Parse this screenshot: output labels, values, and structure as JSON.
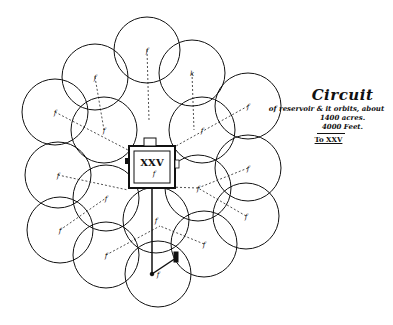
{
  "diagram": {
    "central_label": "XXV",
    "central_mark": "f",
    "legend": {
      "title": "Circuit",
      "line1": "of reservoir & it orbits, about",
      "line2": "1400 acres.",
      "line3": "4000 Feet.",
      "scale_label": "To XXV"
    },
    "circles": [
      {
        "cx": 147,
        "cy": 50,
        "label": "f"
      },
      {
        "cx": 192,
        "cy": 73,
        "label": "k"
      },
      {
        "cx": 248,
        "cy": 106,
        "label": "f"
      },
      {
        "cx": 95,
        "cy": 77,
        "label": "f"
      },
      {
        "cx": 55,
        "cy": 112,
        "label": "f"
      },
      {
        "cx": 104,
        "cy": 130,
        "label": "f"
      },
      {
        "cx": 202,
        "cy": 130,
        "label": "f"
      },
      {
        "cx": 248,
        "cy": 168,
        "label": "f"
      },
      {
        "cx": 58,
        "cy": 175,
        "label": "f"
      },
      {
        "cx": 106,
        "cy": 198,
        "label": "f"
      },
      {
        "cx": 198,
        "cy": 188,
        "label": "f"
      },
      {
        "cx": 246,
        "cy": 216,
        "label": "f"
      },
      {
        "cx": 60,
        "cy": 230,
        "label": "f"
      },
      {
        "cx": 106,
        "cy": 255,
        "label": "f"
      },
      {
        "cx": 204,
        "cy": 244,
        "label": "f"
      },
      {
        "cx": 158,
        "cy": 274,
        "label": "f"
      },
      {
        "cx": 156,
        "cy": 220,
        "label": "f"
      }
    ],
    "colors": {
      "ink": "#111111",
      "paper": "#ffffff"
    }
  }
}
